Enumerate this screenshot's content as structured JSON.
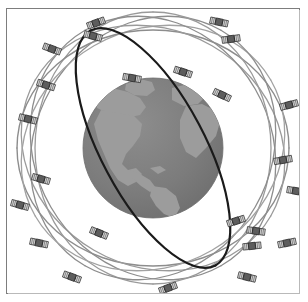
{
  "figure": {
    "canvas": {
      "width": 308,
      "height": 302
    },
    "frame": {
      "name": "image-border",
      "x": 6,
      "y": 8,
      "width": 294,
      "height": 286,
      "stroke": "#7d7d7d",
      "shadow": "#b9b9b9"
    },
    "background_color": "#ffffff"
  },
  "earth": {
    "label": "Earth",
    "center_x": 153,
    "center_y": 148,
    "radius": 70,
    "ocean_color": "#7c7c7c",
    "land_color": "#9c9c9c",
    "outline_color": "#6e6e6e",
    "landmasses": [
      "North America",
      "South America",
      "Greenland",
      "Europe",
      "Africa"
    ]
  },
  "orbits": {
    "plane_count": 7,
    "highlight_color": "#1a1a1a",
    "normal_color": "#8d8d8d",
    "light_color": "#a8a8a8",
    "stroke_width_normal": 1.3,
    "stroke_width_highlight": 2.2,
    "planes": [
      {
        "id": "orbit-1",
        "rx": 136,
        "ry": 118,
        "rotation": 0,
        "color": "#8d8d8d",
        "width": 1.4
      },
      {
        "id": "orbit-2",
        "rx": 136,
        "ry": 118,
        "rotation": 30,
        "color": "#9a9a9a",
        "width": 1.3
      },
      {
        "id": "orbit-3",
        "rx": 136,
        "ry": 118,
        "rotation": 60,
        "color": "#8d8d8d",
        "width": 1.3
      },
      {
        "id": "orbit-4",
        "rx": 136,
        "ry": 118,
        "rotation": 90,
        "color": "#9a9a9a",
        "width": 1.3
      },
      {
        "id": "orbit-5",
        "rx": 136,
        "ry": 118,
        "rotation": 120,
        "color": "#8d8d8d",
        "width": 1.3
      },
      {
        "id": "orbit-6",
        "rx": 136,
        "ry": 118,
        "rotation": 150,
        "color": "#a2a2a2",
        "width": 1.3
      },
      {
        "id": "orbit-highlight",
        "rx": 133,
        "ry": 52,
        "rotation": 62,
        "color": "#1a1a1a",
        "width": 2.2
      }
    ]
  },
  "satellites": {
    "count": 24,
    "body_color": "#5d5d5d",
    "panel_color": "#d8d8d8",
    "outline_color": "#2b2b2b",
    "items": [
      {
        "id": "sat-01",
        "x": 96,
        "y": 23,
        "rotation": -20
      },
      {
        "id": "sat-02",
        "x": 93,
        "y": 36,
        "rotation": 15
      },
      {
        "id": "sat-03",
        "x": 52,
        "y": 49,
        "rotation": 20
      },
      {
        "id": "sat-04",
        "x": 219,
        "y": 22,
        "rotation": 12
      },
      {
        "id": "sat-05",
        "x": 231,
        "y": 39,
        "rotation": -8
      },
      {
        "id": "sat-06",
        "x": 183,
        "y": 72,
        "rotation": 18
      },
      {
        "id": "sat-07",
        "x": 222,
        "y": 95,
        "rotation": 25
      },
      {
        "id": "sat-08",
        "x": 28,
        "y": 119,
        "rotation": 14
      },
      {
        "id": "sat-09",
        "x": 289,
        "y": 105,
        "rotation": -15
      },
      {
        "id": "sat-10",
        "x": 41,
        "y": 179,
        "rotation": 16
      },
      {
        "id": "sat-11",
        "x": 296,
        "y": 191,
        "rotation": 10
      },
      {
        "id": "sat-12",
        "x": 236,
        "y": 221,
        "rotation": -18
      },
      {
        "id": "sat-13",
        "x": 99,
        "y": 233,
        "rotation": 22
      },
      {
        "id": "sat-14",
        "x": 256,
        "y": 231,
        "rotation": 8
      },
      {
        "id": "sat-15",
        "x": 39,
        "y": 243,
        "rotation": 12
      },
      {
        "id": "sat-16",
        "x": 287,
        "y": 243,
        "rotation": -12
      },
      {
        "id": "sat-17",
        "x": 72,
        "y": 277,
        "rotation": 20
      },
      {
        "id": "sat-18",
        "x": 168,
        "y": 288,
        "rotation": -20
      },
      {
        "id": "sat-19",
        "x": 247,
        "y": 277,
        "rotation": 14
      },
      {
        "id": "sat-20",
        "x": 252,
        "y": 246,
        "rotation": -6
      },
      {
        "id": "sat-21",
        "x": 132,
        "y": 78,
        "rotation": 10
      },
      {
        "id": "sat-22",
        "x": 46,
        "y": 85,
        "rotation": 18
      },
      {
        "id": "sat-23",
        "x": 283,
        "y": 160,
        "rotation": -10
      },
      {
        "id": "sat-24",
        "x": 20,
        "y": 205,
        "rotation": 16
      }
    ]
  },
  "chart_data": {
    "type": "scatter",
    "xlabel": "",
    "ylabel": "",
    "series": [
      {
        "name": "Satellites",
        "count": 24,
        "marker": "satellite-icon"
      },
      {
        "name": "Orbital planes",
        "count": 7,
        "marker": "ellipse"
      },
      {
        "name": "Earth",
        "count": 1,
        "marker": "sphere"
      }
    ],
    "legend_position": "none",
    "grid": false
  }
}
